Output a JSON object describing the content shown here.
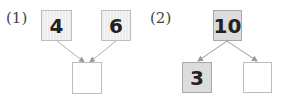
{
  "problems": [
    {
      "label": "(1)",
      "top_left": "4",
      "top_right": "6",
      "bottom": "",
      "type": "compose"
    },
    {
      "label": "(2)",
      "top": "10",
      "bottom_left": "3",
      "bottom_right": "",
      "type": "decompose"
    }
  ],
  "colors": {
    "box_border": "#bdbdbd",
    "arrow": "#aaaaaa",
    "shaded_fill": "#dcdcdc",
    "striped_fill": "#efefef"
  }
}
